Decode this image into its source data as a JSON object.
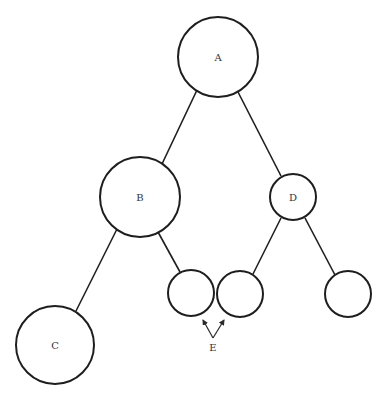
{
  "diagram": {
    "type": "tree",
    "stroke_color": "#1e1e1e",
    "background_color": "#ffffff",
    "nodes": [
      {
        "id": "A",
        "label": "A",
        "cx": 218,
        "cy": 57,
        "r": 40
      },
      {
        "id": "B",
        "label": "B",
        "cx": 140,
        "cy": 197,
        "r": 40
      },
      {
        "id": "D",
        "label": "D",
        "cx": 293,
        "cy": 197,
        "r": 23
      },
      {
        "id": "C",
        "label": "C",
        "cx": 55,
        "cy": 345,
        "r": 39
      },
      {
        "id": "E1",
        "label": "",
        "cx": 191,
        "cy": 293,
        "r": 23
      },
      {
        "id": "E2",
        "label": "",
        "cx": 240,
        "cy": 294,
        "r": 23
      },
      {
        "id": "F",
        "label": "",
        "cx": 348,
        "cy": 294,
        "r": 23
      }
    ],
    "edges": [
      {
        "from": "A",
        "to": "B",
        "x1": 197,
        "y1": 90,
        "x2": 162,
        "y2": 164
      },
      {
        "from": "A",
        "to": "D",
        "x1": 238,
        "y1": 92,
        "x2": 281,
        "y2": 176
      },
      {
        "from": "B",
        "to": "C",
        "x1": 117,
        "y1": 229,
        "x2": 76,
        "y2": 311
      },
      {
        "from": "B",
        "to": "E1",
        "x1": 158,
        "y1": 232,
        "x2": 180,
        "y2": 272
      },
      {
        "from": "D",
        "to": "E2",
        "x1": 281,
        "y1": 218,
        "x2": 253,
        "y2": 274
      },
      {
        "from": "D",
        "to": "F",
        "x1": 305,
        "y1": 218,
        "x2": 335,
        "y2": 275
      }
    ],
    "callout": {
      "label": "E",
      "label_x": 213,
      "label_y": 347,
      "vertex_x": 213,
      "vertex_y": 338,
      "targets": [
        {
          "node": "E1",
          "x": 203,
          "y": 320
        },
        {
          "node": "E2",
          "x": 224,
          "y": 320
        }
      ]
    }
  }
}
